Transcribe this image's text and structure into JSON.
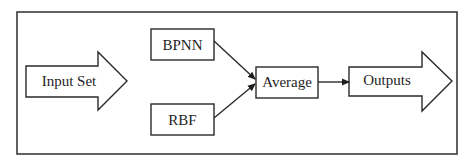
{
  "diagram": {
    "type": "flowchart",
    "nodes": [
      {
        "id": "input_set",
        "label": "Input Set",
        "shape": "block-arrow-right"
      },
      {
        "id": "bpnn",
        "label": "BPNN",
        "shape": "rectangle"
      },
      {
        "id": "rbf",
        "label": "RBF",
        "shape": "rectangle"
      },
      {
        "id": "average",
        "label": "Average",
        "shape": "rectangle"
      },
      {
        "id": "outputs",
        "label": "Outputs",
        "shape": "block-arrow-right"
      }
    ],
    "edges": [
      {
        "from": "bpnn",
        "to": "average",
        "style": "arrow"
      },
      {
        "from": "rbf",
        "to": "average",
        "style": "arrow"
      },
      {
        "from": "average",
        "to": "outputs",
        "style": "arrow"
      }
    ],
    "colors": {
      "stroke": "#2a2a2a",
      "fill": "#ffffff",
      "text": "#1e1e1e"
    }
  },
  "labels": {
    "input_set": "Input Set",
    "bpnn": "BPNN",
    "rbf": "RBF",
    "average": "Average",
    "outputs": "Outputs"
  }
}
